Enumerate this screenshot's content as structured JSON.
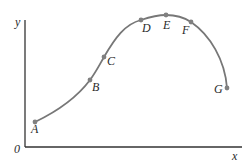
{
  "diagram": {
    "axes": {
      "x_label": "x",
      "y_label": "y",
      "origin_label": "0",
      "color": "#333333"
    },
    "curve": {
      "color": "#777777",
      "point_color": "#808080"
    },
    "points": [
      {
        "label": "A"
      },
      {
        "label": "B"
      },
      {
        "label": "C"
      },
      {
        "label": "D"
      },
      {
        "label": "E"
      },
      {
        "label": "F"
      },
      {
        "label": "G"
      }
    ]
  }
}
